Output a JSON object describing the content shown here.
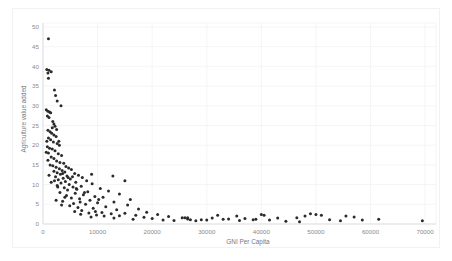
{
  "chart_data": {
    "type": "scatter",
    "title": "",
    "xlabel": "GNI Per Capita",
    "ylabel": "Agriculture value added",
    "xlim": [
      0,
      72000
    ],
    "ylim": [
      0,
      51
    ],
    "xticks": [
      0,
      10000,
      20000,
      30000,
      40000,
      50000,
      60000,
      70000
    ],
    "xtick_labels": [
      "0",
      "10000",
      "20000",
      "30000",
      "40000",
      "50000",
      "60000",
      "70000"
    ],
    "yticks": [
      0,
      5,
      10,
      15,
      20,
      25,
      30,
      35,
      40,
      45,
      50
    ],
    "ytick_labels": [
      "0",
      "5",
      "10",
      "15",
      "20",
      "25",
      "30",
      "35",
      "40",
      "45",
      "50"
    ],
    "grid": true,
    "legend": "none",
    "marker_color": "#2b2b2e",
    "marker_size": 1.5,
    "points": [
      [
        1000,
        47.0
      ],
      [
        700,
        39.2
      ],
      [
        1100,
        39.0
      ],
      [
        1500,
        38.6
      ],
      [
        900,
        38.3
      ],
      [
        1000,
        37.0
      ],
      [
        2100,
        34.0
      ],
      [
        2300,
        32.6
      ],
      [
        2600,
        31.2
      ],
      [
        3300,
        30.0
      ],
      [
        600,
        29.0
      ],
      [
        900,
        28.6
      ],
      [
        1200,
        28.4
      ],
      [
        1400,
        28.2
      ],
      [
        800,
        27.4
      ],
      [
        1100,
        27.0
      ],
      [
        2000,
        25.4
      ],
      [
        2200,
        24.8
      ],
      [
        1700,
        24.4
      ],
      [
        2500,
        24.0
      ],
      [
        900,
        23.8
      ],
      [
        1300,
        23.4
      ],
      [
        1600,
        23.0
      ],
      [
        2000,
        22.6
      ],
      [
        2400,
        22.2
      ],
      [
        1000,
        21.8
      ],
      [
        1400,
        21.4
      ],
      [
        700,
        21.0
      ],
      [
        1900,
        20.8
      ],
      [
        2600,
        20.4
      ],
      [
        3000,
        20.0
      ],
      [
        800,
        19.6
      ],
      [
        1200,
        19.2
      ],
      [
        1700,
        19.0
      ],
      [
        2200,
        18.6
      ],
      [
        600,
        18.2
      ],
      [
        1000,
        18.0
      ],
      [
        2800,
        17.8
      ],
      [
        3400,
        17.4
      ],
      [
        1500,
        17.0
      ],
      [
        2000,
        16.6
      ],
      [
        900,
        16.2
      ],
      [
        2500,
        16.0
      ],
      [
        3100,
        15.6
      ],
      [
        3800,
        15.4
      ],
      [
        1300,
        15.0
      ],
      [
        1800,
        14.8
      ],
      [
        4200,
        14.6
      ],
      [
        2400,
        14.4
      ],
      [
        4700,
        14.2
      ],
      [
        3000,
        14.0
      ],
      [
        5200,
        13.8
      ],
      [
        3500,
        13.6
      ],
      [
        2000,
        13.4
      ],
      [
        4000,
        13.2
      ],
      [
        2600,
        13.0
      ],
      [
        5800,
        12.8
      ],
      [
        3200,
        12.6
      ],
      [
        6500,
        12.4
      ],
      [
        4400,
        12.2
      ],
      [
        2300,
        12.0
      ],
      [
        7200,
        11.8
      ],
      [
        3700,
        11.6
      ],
      [
        5000,
        11.4
      ],
      [
        2800,
        11.2
      ],
      [
        8000,
        11.0
      ],
      [
        4100,
        10.8
      ],
      [
        6000,
        10.6
      ],
      [
        3300,
        10.4
      ],
      [
        9000,
        10.2
      ],
      [
        4800,
        10.0
      ],
      [
        2600,
        9.8
      ],
      [
        7000,
        9.6
      ],
      [
        5500,
        9.4
      ],
      [
        3900,
        9.2
      ],
      [
        10500,
        9.0
      ],
      [
        6200,
        8.8
      ],
      [
        4500,
        8.6
      ],
      [
        12000,
        8.4
      ],
      [
        8200,
        8.2
      ],
      [
        3100,
        8.0
      ],
      [
        5900,
        7.8
      ],
      [
        14000,
        7.6
      ],
      [
        7400,
        7.4
      ],
      [
        4300,
        7.2
      ],
      [
        9500,
        7.0
      ],
      [
        11000,
        6.8
      ],
      [
        5200,
        6.6
      ],
      [
        6700,
        6.4
      ],
      [
        16000,
        6.2
      ],
      [
        8600,
        6.0
      ],
      [
        3600,
        5.8
      ],
      [
        13000,
        5.6
      ],
      [
        10000,
        5.4
      ],
      [
        5600,
        5.2
      ],
      [
        7800,
        5.0
      ],
      [
        15500,
        4.8
      ],
      [
        4900,
        4.6
      ],
      [
        11500,
        4.4
      ],
      [
        6400,
        4.2
      ],
      [
        9200,
        4.0
      ],
      [
        17500,
        3.8
      ],
      [
        13500,
        3.6
      ],
      [
        7100,
        3.4
      ],
      [
        5800,
        3.2
      ],
      [
        19000,
        3.0
      ],
      [
        10800,
        2.9
      ],
      [
        8400,
        2.8
      ],
      [
        15000,
        2.7
      ],
      [
        12500,
        2.6
      ],
      [
        6900,
        2.5
      ],
      [
        21000,
        2.4
      ],
      [
        9800,
        2.3
      ],
      [
        17000,
        2.2
      ],
      [
        14000,
        2.1
      ],
      [
        11200,
        2.0
      ],
      [
        23000,
        1.9
      ],
      [
        8800,
        1.8
      ],
      [
        18500,
        1.7
      ],
      [
        25500,
        1.6
      ],
      [
        13000,
        1.5
      ],
      [
        20000,
        1.4
      ],
      [
        26500,
        1.3
      ],
      [
        16500,
        1.2
      ],
      [
        29000,
        1.1
      ],
      [
        22000,
        1.0
      ],
      [
        31000,
        1.5
      ],
      [
        27000,
        1.1
      ],
      [
        24000,
        0.9
      ],
      [
        33000,
        1.2
      ],
      [
        28000,
        0.8
      ],
      [
        35500,
        2.0
      ],
      [
        30000,
        1.0
      ],
      [
        37000,
        1.4
      ],
      [
        32000,
        2.2
      ],
      [
        26000,
        1.6
      ],
      [
        26500,
        1.6
      ],
      [
        38500,
        1.1
      ],
      [
        34000,
        1.3
      ],
      [
        40000,
        2.4
      ],
      [
        40500,
        2.2
      ],
      [
        41500,
        1.0
      ],
      [
        36000,
        0.9
      ],
      [
        43000,
        1.5
      ],
      [
        44500,
        0.7
      ],
      [
        39000,
        1.2
      ],
      [
        46500,
        1.6
      ],
      [
        48000,
        2.0
      ],
      [
        49000,
        2.6
      ],
      [
        50000,
        2.4
      ],
      [
        51000,
        2.2
      ],
      [
        52500,
        1.1
      ],
      [
        54500,
        0.8
      ],
      [
        47000,
        0.6
      ],
      [
        55500,
        2.0
      ],
      [
        57000,
        1.8
      ],
      [
        58500,
        1.0
      ],
      [
        61500,
        1.2
      ],
      [
        69500,
        0.8
      ],
      [
        1800,
        26.0
      ],
      [
        2900,
        21.0
      ],
      [
        1100,
        12.4
      ],
      [
        2100,
        11.0
      ],
      [
        3600,
        12.8
      ],
      [
        4600,
        11.8
      ],
      [
        6100,
        9.0
      ],
      [
        7600,
        8.0
      ],
      [
        1500,
        10.6
      ],
      [
        2700,
        9.4
      ],
      [
        4000,
        6.8
      ],
      [
        5400,
        12.0
      ],
      [
        8900,
        12.6
      ],
      [
        12800,
        12.2
      ],
      [
        10200,
        6.2
      ],
      [
        15000,
        11.0
      ],
      [
        2400,
        6.0
      ],
      [
        3400,
        4.8
      ],
      [
        6800,
        5.6
      ],
      [
        9600,
        3.2
      ]
    ]
  }
}
